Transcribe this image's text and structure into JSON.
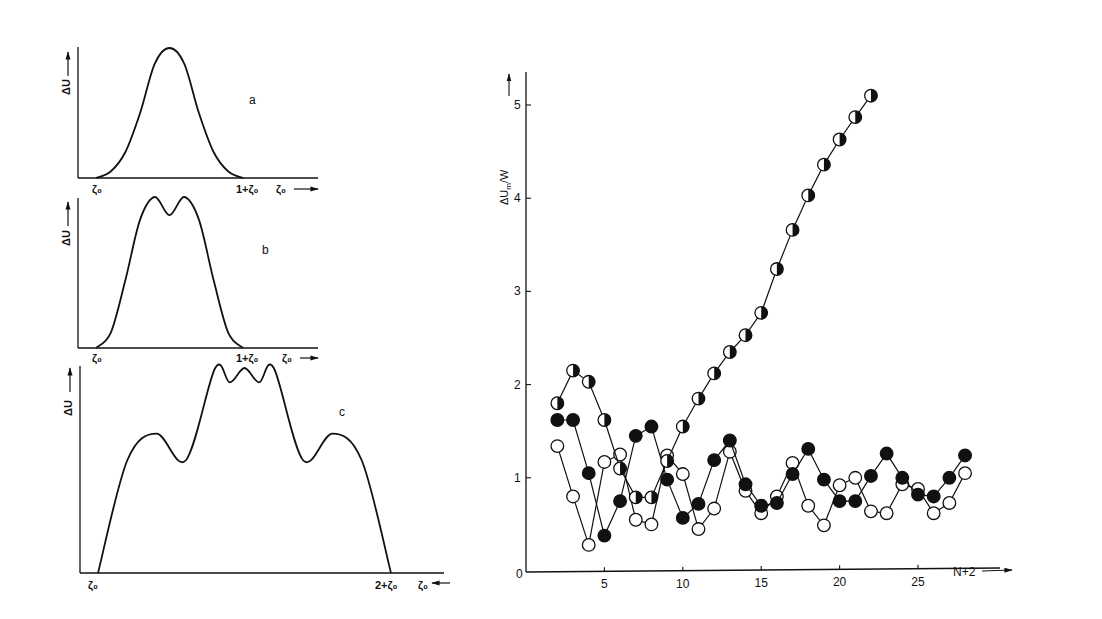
{
  "chart_data": [
    {
      "panel": "a",
      "type": "line",
      "title": "a",
      "xlabel": "ζ₀",
      "ylabel": "ΔU",
      "x_ticks": [
        "ζ₀",
        "1+ζ₀"
      ],
      "shape": "single Gaussian peak centered at ζ₀+0.5",
      "x": [
        0,
        0.1,
        0.2,
        0.3,
        0.4,
        0.5,
        0.6,
        0.7,
        0.8,
        0.9,
        1.0
      ],
      "values": [
        0,
        0.05,
        0.2,
        0.5,
        0.88,
        1.0,
        0.88,
        0.5,
        0.2,
        0.05,
        0
      ]
    },
    {
      "panel": "b",
      "type": "line",
      "title": "b",
      "xlabel": "ζ₀",
      "ylabel": "ΔU",
      "x_ticks": [
        "ζ₀",
        "1+ζ₀"
      ],
      "shape": "double peak with shallow central dip",
      "x": [
        0,
        0.1,
        0.2,
        0.3,
        0.4,
        0.5,
        0.6,
        0.7,
        0.8,
        0.9,
        1.0
      ],
      "values": [
        0,
        0.1,
        0.45,
        0.85,
        1.0,
        0.88,
        1.0,
        0.85,
        0.45,
        0.1,
        0
      ]
    },
    {
      "panel": "c",
      "type": "line",
      "title": "c",
      "xlabel": "ζ₀",
      "ylabel": "ΔU",
      "x_ticks": [
        "ζ₀",
        "1+ζ₀",
        "2+ζ₀"
      ],
      "shape": "two side humps and a double-peaked central maximum",
      "x": [
        0,
        0.2,
        0.4,
        0.6,
        0.8,
        0.9,
        1.0,
        1.1,
        1.2,
        1.4,
        1.6,
        1.8,
        2.0
      ],
      "values": [
        0,
        0.55,
        0.68,
        0.55,
        1.0,
        0.93,
        1.0,
        0.93,
        1.0,
        0.55,
        0.68,
        0.55,
        0
      ]
    },
    {
      "panel": "main",
      "type": "scatter",
      "title": "",
      "xlabel": "N+2",
      "ylabel": "ΔU_m/W",
      "xlim": [
        0,
        29
      ],
      "ylim": [
        0,
        5.4
      ],
      "x_ticks": [
        5,
        10,
        15,
        20,
        25
      ],
      "y_ticks": [
        0,
        1,
        2,
        3,
        4,
        5
      ],
      "grid": false,
      "series": [
        {
          "name": "half-filled circles",
          "marker": "half-filled",
          "x": [
            2,
            3,
            4,
            5,
            6,
            7,
            8,
            9,
            10,
            11,
            12,
            13,
            14,
            15,
            16,
            17,
            18,
            19,
            20,
            21,
            22
          ],
          "values": [
            1.8,
            2.15,
            2.03,
            1.62,
            1.1,
            0.79,
            0.79,
            1.18,
            1.55,
            1.85,
            2.12,
            2.35,
            2.53,
            2.77,
            3.24,
            3.66,
            4.03,
            4.36,
            4.63,
            4.87,
            5.1
          ]
        },
        {
          "name": "filled circles",
          "marker": "filled",
          "x": [
            2,
            3,
            4,
            5,
            6,
            7,
            8,
            9,
            10,
            11,
            12,
            13,
            14,
            15,
            16,
            17,
            18,
            19,
            20,
            21,
            22,
            23,
            24,
            25,
            26,
            27,
            28
          ],
          "values": [
            1.62,
            1.62,
            1.05,
            0.38,
            0.75,
            1.45,
            1.55,
            0.98,
            0.57,
            0.72,
            1.19,
            1.4,
            0.93,
            0.7,
            0.73,
            1.04,
            1.31,
            0.98,
            0.75,
            0.75,
            1.02,
            1.26,
            1.0,
            0.82,
            0.8,
            1.0,
            1.24
          ]
        },
        {
          "name": "open circles",
          "marker": "open",
          "x": [
            2,
            3,
            4,
            5,
            6,
            7,
            8,
            9,
            10,
            11,
            12,
            13,
            14,
            15,
            16,
            17,
            18,
            19,
            20,
            21,
            22,
            23,
            24,
            25,
            26,
            27,
            28
          ],
          "values": [
            1.34,
            0.8,
            0.28,
            1.17,
            1.25,
            0.55,
            0.5,
            1.24,
            1.04,
            0.45,
            0.67,
            1.28,
            0.86,
            0.62,
            0.8,
            1.16,
            0.7,
            0.49,
            0.92,
            1.0,
            0.64,
            0.62,
            0.93,
            0.88,
            0.62,
            0.73,
            1.05
          ]
        }
      ]
    }
  ],
  "labels": {
    "panel_a": "a",
    "panel_b": "b",
    "panel_c": "c",
    "delta_u": "ΔU",
    "zeta0": "ζ₀",
    "one_plus_zeta0": "1+ζ₀",
    "two_plus_zeta0": "2+ζ₀",
    "main_ylabel": "ΔU",
    "main_ylabel_sub": "m",
    "main_ylabel_tail": "/W",
    "main_xlabel": "N+2",
    "zero": "0"
  }
}
